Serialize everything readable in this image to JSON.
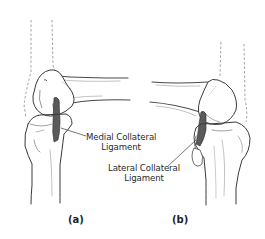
{
  "figure": {
    "panels": [
      {
        "tag": "(a)",
        "structure": "knee-joint",
        "label": {
          "line1": "Medial Collateral",
          "line2": "Ligament"
        }
      },
      {
        "tag": "(b)",
        "structure": "knee-joint",
        "label": {
          "line1": "Lateral Collateral",
          "line2": "Ligament"
        }
      }
    ],
    "colors": {
      "ink": "#3a3a3a",
      "shade": "#6b6b6b",
      "dashed": "#8a8a8a",
      "background": "#ffffff"
    }
  }
}
